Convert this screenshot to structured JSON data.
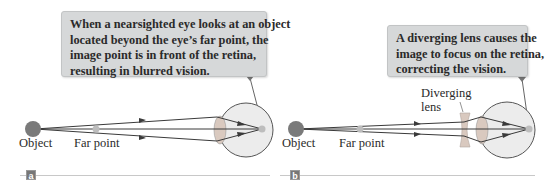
{
  "panels": [
    {
      "id": "a",
      "tag": "a",
      "callout_lines": [
        "When a nearsighted eye looks at an object",
        "located beyond the eye’s far point, the",
        "image point is in front of the retina,",
        "resulting in blurred vision."
      ],
      "labels": {
        "object": "Object",
        "far_point": "Far point"
      }
    },
    {
      "id": "b",
      "tag": "b",
      "callout_lines": [
        "A diverging lens causes the",
        "image to focus on the retina,",
        "correcting the vision."
      ],
      "labels": {
        "object": "Object",
        "far_point": "Far point",
        "lens_line1": "Diverging",
        "lens_line2": "lens"
      }
    }
  ],
  "colors": {
    "callout_bg": "#d6d8d9",
    "object": "#7a7a7a",
    "eye_fill": "#ececec",
    "ray": "#3a3a3a",
    "lens": "#d9c9bf"
  }
}
